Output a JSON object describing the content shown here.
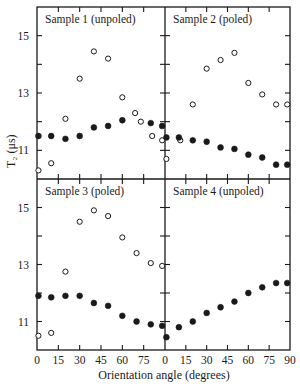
{
  "chart_data": {
    "type": "scatter",
    "title": "",
    "xlabel": "Orientation angle (degrees)",
    "ylabel": "T₂ (μs)",
    "xlim": [
      0,
      90
    ],
    "ylim": [
      10,
      16
    ],
    "xticks": [
      0,
      15,
      30,
      45,
      60,
      75,
      90
    ],
    "xtick_labels_left": [
      "0",
      "15",
      "30",
      "45",
      "60",
      "75"
    ],
    "xtick_labels_right": [
      "0",
      "15",
      "30",
      "45",
      "60",
      "75",
      "90"
    ],
    "yticks": [
      11,
      13,
      15
    ],
    "grid": false,
    "layout": "2x2 panels sharing axes",
    "panels": [
      {
        "label": "Sample 1 (unpoled)",
        "position": "top-left",
        "series": [
          {
            "name": "open",
            "marker": "open-circle",
            "x": [
              1,
              10,
              20,
              30,
              40,
              50,
              60,
              69,
              73,
              81,
              88
            ],
            "y": [
              10.3,
              10.55,
              12.1,
              13.5,
              14.45,
              14.2,
              12.85,
              12.3,
              12.0,
              11.5,
              11.35
            ]
          },
          {
            "name": "filled",
            "marker": "filled-circle",
            "x": [
              1,
              10,
              20,
              30,
              40,
              50,
              60,
              80,
              88
            ],
            "y": [
              11.5,
              11.5,
              11.4,
              11.5,
              11.8,
              11.85,
              12.05,
              11.95,
              11.85
            ]
          }
        ]
      },
      {
        "label": "Sample 2  (poled)",
        "position": "top-right",
        "series": [
          {
            "name": "open",
            "marker": "open-circle",
            "x": [
              1,
              11,
              20,
              30,
              40,
              50,
              60,
              70,
              80,
              88
            ],
            "y": [
              10.7,
              11.35,
              12.6,
              13.85,
              14.15,
              14.4,
              13.35,
              12.95,
              12.6,
              12.6
            ]
          },
          {
            "name": "filled",
            "marker": "filled-circle",
            "x": [
              1,
              10,
              20,
              30,
              40,
              50,
              60,
              70,
              80,
              88
            ],
            "y": [
              11.45,
              11.45,
              11.35,
              11.3,
              11.1,
              11.05,
              10.85,
              10.75,
              10.5,
              10.5
            ]
          }
        ]
      },
      {
        "label": "Sample 3 (poled)",
        "position": "bottom-left",
        "series": [
          {
            "name": "open",
            "marker": "open-circle",
            "x": [
              1,
              10,
              20,
              30,
              40,
              50,
              60,
              70,
              80,
              88
            ],
            "y": [
              10.5,
              10.6,
              12.75,
              14.5,
              14.9,
              14.7,
              13.95,
              13.4,
              13.05,
              12.95
            ]
          },
          {
            "name": "filled",
            "marker": "filled-circle",
            "x": [
              1,
              10,
              20,
              30,
              40,
              50,
              60,
              70,
              80,
              88
            ],
            "y": [
              11.9,
              11.85,
              11.9,
              11.9,
              11.65,
              11.55,
              11.2,
              11.0,
              10.9,
              10.85
            ]
          }
        ]
      },
      {
        "label": "Sample 4 (unpoled)",
        "position": "bottom-right",
        "series": [
          {
            "name": "filled",
            "marker": "filled-circle",
            "x": [
              1,
              10,
              20,
              30,
              40,
              50,
              60,
              70,
              80,
              88
            ],
            "y": [
              10.45,
              10.8,
              11.0,
              11.3,
              11.5,
              11.7,
              12.0,
              12.2,
              12.35,
              12.35
            ]
          }
        ]
      }
    ]
  },
  "colors": {
    "ink": "#1a1a1a",
    "background": "#ffffff"
  }
}
